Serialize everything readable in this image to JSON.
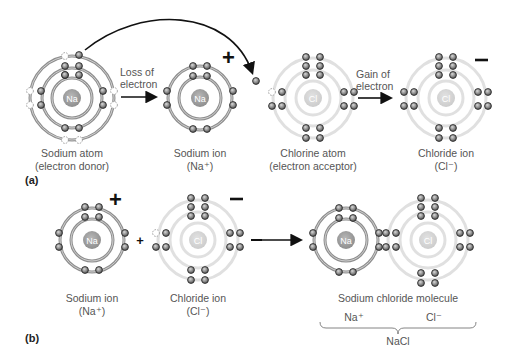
{
  "colors": {
    "na_shell": "#8a8a8a",
    "cl_shell": "#dcdcdc",
    "na_nucleus": "#a0a0a0",
    "cl_nucleus": "#d3d3d3",
    "electron": "#7a7a7a",
    "electron_stroke": "#2a2a2a",
    "ghost_electron": "#ffffff",
    "arrow": "#111111",
    "text": "#555555"
  },
  "panel_a": {
    "label": "(a)",
    "sodium_atom": {
      "symbol": "Na",
      "title": "Sodium atom",
      "subtitle": "(electron donor)",
      "shells": 3,
      "electrons": [
        2,
        8,
        1
      ]
    },
    "loss_label_line1": "Loss of",
    "loss_label_line2": "electron",
    "sodium_ion": {
      "symbol": "Na",
      "charge": "+",
      "title": "Sodium ion",
      "subtitle": "(Na⁺)",
      "shells": 2,
      "electrons": [
        2,
        8
      ]
    },
    "chlorine_atom": {
      "symbol": "Cl",
      "title": "Chlorine atom",
      "subtitle": "(electron acceptor)",
      "shells": 3,
      "electrons": [
        2,
        8,
        7
      ]
    },
    "gain_label_line1": "Gain of",
    "gain_label_line2": "electron",
    "chloride_ion": {
      "symbol": "Cl",
      "charge": "—",
      "title": "Chloride ion",
      "subtitle": "(Cl⁻)",
      "shells": 3,
      "electrons": [
        2,
        8,
        8
      ]
    }
  },
  "panel_b": {
    "label": "(b)",
    "sodium_ion": {
      "symbol": "Na",
      "charge": "+",
      "title": "Sodium ion",
      "subtitle": "(Na⁺)"
    },
    "plus": "+",
    "chloride_ion": {
      "symbol": "Cl",
      "charge": "—",
      "title": "Chloride ion",
      "subtitle": "(Cl⁻)"
    },
    "molecule": {
      "title": "Sodium chloride molecule",
      "na_label": "Na⁺",
      "cl_label": "Cl⁻",
      "formula": "NaCl",
      "na_symbol": "Na",
      "cl_symbol": "Cl"
    }
  }
}
